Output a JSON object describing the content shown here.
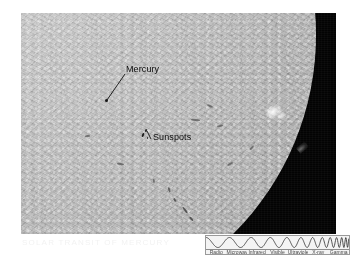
{
  "page": {
    "background_color": "#ffffff",
    "width": 352,
    "height": 255
  },
  "photo": {
    "alt_description": "Hydrogen-alpha photograph of the Sun showing the solar limb, granulated chromosphere, sunspots and the planet Mercury in transit",
    "sky_color": "#030303",
    "disk_color": "#c6c6c6",
    "annotations": [
      {
        "name": "mercury",
        "label": "Mercury",
        "leader": true,
        "marker": "small-black-dot"
      },
      {
        "name": "sunspots",
        "label": "Sunspots",
        "leader": true,
        "marker": "dark-speck-group"
      }
    ],
    "features": [
      {
        "name": "plage",
        "label": "bright plage near right limb"
      },
      {
        "name": "prominence",
        "label": "prominence at limb"
      },
      {
        "name": "filaments",
        "label": "dark filaments"
      }
    ]
  },
  "caption": {
    "text": "SOLAR TRANSIT OF MERCURY"
  },
  "spectrum": {
    "title": "electromagnetic-spectrum-wave",
    "description": "Sine wave of steadily increasing frequency from left to right",
    "labels": [
      "Radio",
      "Microwave",
      "Infrared",
      "Visible",
      "Ultraviolet",
      "X-ray",
      "Gamma"
    ],
    "wave_color": "#2b2b2b",
    "panel_color": "#f4f4f4",
    "border_color": "#9a9a9a"
  },
  "chart_data": {
    "type": "line",
    "xlabel": "Increasing frequency",
    "ylabel": "Amplitude",
    "grid": false,
    "legend": "none",
    "xlim": [
      0,
      143
    ],
    "ylim": [
      -1,
      1
    ],
    "annotations": [
      "Radio",
      "Microwave",
      "Infrared",
      "Visible",
      "Ultraviolet",
      "X-ray",
      "Gamma"
    ],
    "series": [
      {
        "name": "chirp",
        "note": "sine wave whose wavelength shrinks monotonically left to right",
        "start_wavelength_px": 24,
        "end_wavelength_px": 3,
        "amplitude_px": 5
      }
    ]
  }
}
